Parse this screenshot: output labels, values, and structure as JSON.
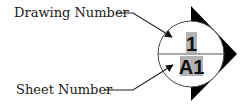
{
  "labels": {
    "drawing_number": "Drawing Number",
    "sheet_number": "Sheet Number"
  },
  "symbol": {
    "drawing_number_value": "1",
    "sheet_number_value": "A1"
  },
  "colors": {
    "highlight": "#b3b3b3",
    "line": "#222222",
    "triangle": "#000000"
  }
}
